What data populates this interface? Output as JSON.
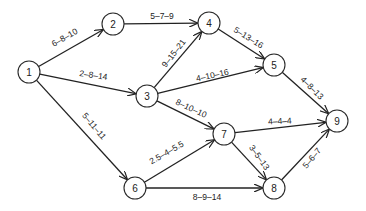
{
  "diagram": {
    "type": "activity-network",
    "colors": {
      "line": "#222222",
      "node_fill": "#ffffff",
      "background": "#ffffff"
    },
    "nodes": [
      {
        "id": "1",
        "label": "1",
        "x": 29,
        "y": 72
      },
      {
        "id": "2",
        "label": "2",
        "x": 113,
        "y": 24
      },
      {
        "id": "3",
        "label": "3",
        "x": 147,
        "y": 96
      },
      {
        "id": "4",
        "label": "4",
        "x": 209,
        "y": 23
      },
      {
        "id": "5",
        "label": "5",
        "x": 274,
        "y": 65
      },
      {
        "id": "6",
        "label": "6",
        "x": 135,
        "y": 188
      },
      {
        "id": "7",
        "label": "7",
        "x": 224,
        "y": 134
      },
      {
        "id": "8",
        "label": "8",
        "x": 274,
        "y": 188
      },
      {
        "id": "9",
        "label": "9",
        "x": 337,
        "y": 121
      }
    ],
    "edges": [
      {
        "from": "1",
        "to": "2",
        "label": "6–8–10",
        "lx": 66,
        "ly": 40,
        "rot": -30
      },
      {
        "from": "1",
        "to": "3",
        "label": "2–8–14",
        "lx": 93,
        "ly": 78,
        "rot": 8
      },
      {
        "from": "1",
        "to": "6",
        "label": "5–11–11",
        "lx": 92,
        "ly": 128,
        "rot": 50
      },
      {
        "from": "2",
        "to": "4",
        "label": "5–7–9",
        "lx": 162,
        "ly": 19,
        "rot": 0
      },
      {
        "from": "3",
        "to": "4",
        "label": "9–15–21",
        "lx": 176,
        "ly": 55,
        "rot": -52
      },
      {
        "from": "3",
        "to": "5",
        "label": "4–10–16",
        "lx": 213,
        "ly": 78,
        "rot": -12
      },
      {
        "from": "3",
        "to": "7",
        "label": "8–10–10",
        "lx": 190,
        "ly": 111,
        "rot": 25
      },
      {
        "from": "4",
        "to": "5",
        "label": "5–13–16",
        "lx": 247,
        "ly": 40,
        "rot": 32
      },
      {
        "from": "5",
        "to": "9",
        "label": "4–8–13",
        "lx": 310,
        "ly": 90,
        "rot": 45
      },
      {
        "from": "6",
        "to": "7",
        "label": "2.5–4–5.5",
        "lx": 168,
        "ly": 155,
        "rot": -30
      },
      {
        "from": "6",
        "to": "8",
        "label": "8–9–14",
        "lx": 207,
        "ly": 200,
        "rot": 0
      },
      {
        "from": "7",
        "to": "9",
        "label": "4–4–4",
        "lx": 280,
        "ly": 124,
        "rot": -3
      },
      {
        "from": "7",
        "to": "8",
        "label": "3–5–13",
        "lx": 257,
        "ly": 159,
        "rot": 55
      },
      {
        "from": "8",
        "to": "9",
        "label": "5–6–7",
        "lx": 314,
        "ly": 160,
        "rot": -50
      }
    ]
  }
}
